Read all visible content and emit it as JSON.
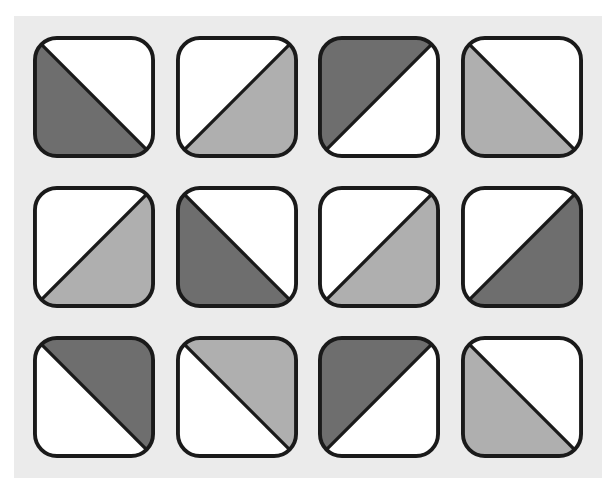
{
  "figure": {
    "type": "tile-grid",
    "title": "",
    "rows": 3,
    "columns": 4,
    "tile_count": 12,
    "background_color": "#ffffff",
    "panel_color": "#ebebeb",
    "tile_fill_color": "#ffffff",
    "tile_border_color": "#1a1a1a",
    "tile_border_width": 4,
    "tile_corner_radius": 22,
    "shade_dark": "#6e6e6e",
    "shade_light": "#afafaf"
  },
  "legend": {
    "shades": [
      {
        "key": "dark",
        "label": "dark gray",
        "color": "#6e6e6e"
      },
      {
        "key": "light",
        "label": "light gray",
        "color": "#afafaf"
      },
      {
        "key": "white",
        "label": "white",
        "color": "#ffffff"
      }
    ],
    "diagonals": [
      {
        "key": "backslash",
        "label": "top-left to bottom-right"
      },
      {
        "key": "slash",
        "label": "top-right to bottom-left"
      }
    ]
  },
  "tiles": [
    {
      "id": "r1c1",
      "row": 1,
      "col": 1,
      "diagonal": "backslash",
      "filled_half": "lower-left",
      "shade": "dark",
      "color": "#6e6e6e",
      "label": "row 1 column 1"
    },
    {
      "id": "r1c2",
      "row": 1,
      "col": 2,
      "diagonal": "slash",
      "filled_half": "lower-left",
      "shade": "light",
      "color": "#afafaf",
      "label": "row 1 column 2"
    },
    {
      "id": "r1c3",
      "row": 1,
      "col": 3,
      "diagonal": "slash",
      "filled_half": "upper-left",
      "shade": "dark",
      "color": "#6e6e6e",
      "label": "row 1 column 3"
    },
    {
      "id": "r1c4",
      "row": 1,
      "col": 4,
      "diagonal": "backslash",
      "filled_half": "lower-right",
      "shade": "light",
      "color": "#afafaf",
      "label": "row 1 column 4"
    },
    {
      "id": "r2c1",
      "row": 2,
      "col": 1,
      "diagonal": "slash",
      "filled_half": "lower-left",
      "shade": "light",
      "color": "#afafaf",
      "label": "row 2 column 1"
    },
    {
      "id": "r2c2",
      "row": 2,
      "col": 2,
      "diagonal": "backslash",
      "filled_half": "lower-right",
      "shade": "dark",
      "color": "#6e6e6e",
      "label": "row 2 column 2"
    },
    {
      "id": "r2c3",
      "row": 2,
      "col": 3,
      "diagonal": "slash",
      "filled_half": "lower-left",
      "shade": "light",
      "color": "#afafaf",
      "label": "row 2 column 3"
    },
    {
      "id": "r2c4",
      "row": 2,
      "col": 4,
      "diagonal": "slash",
      "filled_half": "lower-left",
      "shade": "dark",
      "color": "#6e6e6e",
      "label": "row 2 column 4"
    },
    {
      "id": "r3c1",
      "row": 3,
      "col": 1,
      "diagonal": "backslash",
      "filled_half": "upper-right",
      "shade": "dark",
      "color": "#6e6e6e",
      "label": "row 3 column 1"
    },
    {
      "id": "r3c2",
      "row": 3,
      "col": 2,
      "diagonal": "backslash",
      "filled_half": "upper-right",
      "shade": "light",
      "color": "#afafaf",
      "label": "row 3 column 2"
    },
    {
      "id": "r3c3",
      "row": 3,
      "col": 3,
      "diagonal": "slash",
      "filled_half": "upper-left",
      "shade": "dark",
      "color": "#6e6e6e",
      "label": "row 3 column 3"
    },
    {
      "id": "r3c4",
      "row": 3,
      "col": 4,
      "diagonal": "backslash",
      "filled_half": "lower-right",
      "shade": "light",
      "color": "#afafaf",
      "label": "row 3 column 4"
    }
  ]
}
